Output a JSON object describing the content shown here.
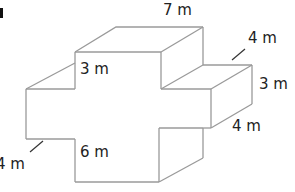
{
  "figure": {
    "title": "",
    "units": "m",
    "edge_color": "#9a9a9a",
    "text_color": "#222222"
  },
  "labels": {
    "top_width": "7 m",
    "right_depth": "4 m",
    "right_height": "3 m",
    "right_arm_lower": "4 m",
    "inner_top": "3 m",
    "inner_bottom": "6 m",
    "left_depth": "4 m"
  }
}
